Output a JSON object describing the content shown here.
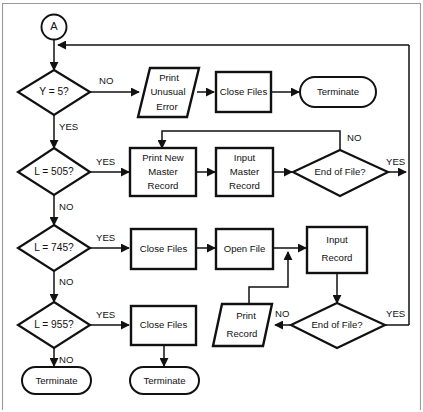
{
  "diagram": {
    "type": "flowchart",
    "entry_connector": {
      "label": "A"
    },
    "colors": {
      "line": "#111111",
      "fill": "#ffffff",
      "border": "#9a9a9a"
    },
    "nodes": [
      {
        "id": "conn-a",
        "shape": "connector",
        "text": "A"
      },
      {
        "id": "dec-y5",
        "shape": "decision",
        "text": "Y = 5?"
      },
      {
        "id": "print-unusual",
        "shape": "parallelogram",
        "line1": "Print",
        "line2": "Unusual",
        "line3": "Error"
      },
      {
        "id": "close-files-1",
        "shape": "process",
        "text": "Close Files"
      },
      {
        "id": "terminate-1",
        "shape": "terminal",
        "text": "Terminate"
      },
      {
        "id": "dec-l505",
        "shape": "decision",
        "text": "L = 505?"
      },
      {
        "id": "print-new-master",
        "shape": "process",
        "line1": "Print New",
        "line2": "Master",
        "line3": "Record"
      },
      {
        "id": "input-master",
        "shape": "process",
        "line1": "Input",
        "line2": "Master",
        "line3": "Record"
      },
      {
        "id": "eof-1",
        "shape": "decision",
        "text": "End of File?"
      },
      {
        "id": "dec-l745",
        "shape": "decision",
        "text": "L = 745?"
      },
      {
        "id": "close-files-2",
        "shape": "process",
        "text": "Close Files"
      },
      {
        "id": "open-file",
        "shape": "process",
        "text": "Open File"
      },
      {
        "id": "input-record",
        "shape": "process",
        "line1": "Input",
        "line2": "Record"
      },
      {
        "id": "eof-2",
        "shape": "decision",
        "text": "End of File?"
      },
      {
        "id": "print-record",
        "shape": "parallelogram",
        "line1": "Print",
        "line2": "Record"
      },
      {
        "id": "dec-l955",
        "shape": "decision",
        "text": "L = 955?"
      },
      {
        "id": "close-files-3",
        "shape": "process",
        "text": "Close Files"
      },
      {
        "id": "terminate-2",
        "shape": "terminal",
        "text": "Terminate"
      },
      {
        "id": "terminate-3",
        "shape": "terminal",
        "text": "Terminate"
      }
    ],
    "edge_labels": {
      "y5_no": "NO",
      "y5_yes": "YES",
      "l505_yes": "YES",
      "l505_no": "NO",
      "eof1_no": "NO",
      "eof1_yes": "YES",
      "l745_yes": "YES",
      "l745_no": "NO",
      "eof2_no": "NO",
      "eof2_yes": "YES",
      "l955_yes": "YES",
      "l955_no": "NO"
    }
  }
}
